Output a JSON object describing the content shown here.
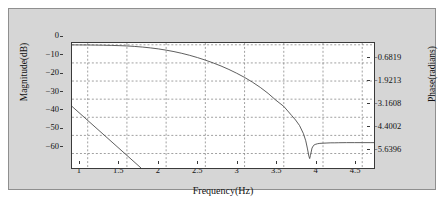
{
  "chart_data": {
    "type": "line",
    "title": "",
    "xlabel": "Frequency(Hz)",
    "ylabel": "Magnitude(dB)",
    "y2label": "Phase(radians)",
    "xlim": [
      0.8,
      4.65
    ],
    "ylim": [
      -68,
      1
    ],
    "y2lim": [
      -6.2661,
      0.5574
    ],
    "grid": true,
    "legend": null,
    "xticks": [
      "1",
      "1.5",
      "2",
      "2.5",
      "3",
      "3.5",
      "4",
      "4.5"
    ],
    "xtick_values": [
      1,
      1.5,
      2,
      2.5,
      3,
      3.5,
      4,
      4.5
    ],
    "yticks": [
      "0",
      "−10",
      "−20",
      "−30",
      "−40",
      "−50",
      "−60"
    ],
    "ytick_values": [
      0,
      -10,
      -20,
      -30,
      -40,
      -50,
      -60
    ],
    "y2ticks": [
      "−0.6819",
      "−1.9213",
      "−3.1608",
      "−4.4002",
      "−5.6396"
    ],
    "y2tick_values": [
      -0.6819,
      -1.9213,
      -3.1608,
      -4.4002,
      -5.6396
    ],
    "series": [
      {
        "name": "Magnitude",
        "axis": "left",
        "units": "dB",
        "color": "#4a4a4a",
        "x": [
          0.8,
          0.9,
          1.0,
          1.1,
          1.2,
          1.3,
          1.4,
          1.5,
          1.6,
          1.7,
          1.8,
          1.9,
          2.0,
          2.1,
          2.2,
          2.3,
          2.4,
          2.5,
          2.6,
          2.7,
          2.8,
          2.9,
          3.0,
          3.1,
          3.2,
          3.3,
          3.4,
          3.5,
          3.6,
          3.65,
          3.7,
          3.75,
          3.78,
          3.8,
          3.82,
          3.83,
          3.84,
          3.86,
          3.88,
          3.9,
          3.93,
          3.96,
          4.0,
          4.05,
          4.1,
          4.15,
          4.2,
          4.3,
          4.4,
          4.5,
          4.6,
          4.65
        ],
        "y": [
          -0.05,
          -0.07,
          -0.1,
          -0.15,
          -0.22,
          -0.32,
          -0.45,
          -0.62,
          -0.9,
          -1.25,
          -1.7,
          -2.25,
          -2.95,
          -3.75,
          -4.7,
          -5.8,
          -7.05,
          -8.45,
          -10.0,
          -11.7,
          -13.6,
          -15.7,
          -18.0,
          -20.6,
          -23.5,
          -26.8,
          -30.6,
          -34.0,
          -39.0,
          -41.5,
          -44.5,
          -49.0,
          -53.0,
          -57.0,
          -61.5,
          -62.8,
          -61.0,
          -57.0,
          -55.5,
          -55.0,
          -54.6,
          -54.4,
          -54.3,
          -54.2,
          -54.1,
          -54.1,
          -54.05,
          -54.0,
          -54.0,
          -54.0,
          -54.0,
          -54.0
        ]
      },
      {
        "name": "Phase",
        "axis": "right",
        "units": "radians",
        "color": "#4a4a4a",
        "x": [
          0.8,
          1.68
        ],
        "y_db": [
          -34.0,
          -68.0
        ],
        "y_radians": [
          -3.38,
          -6.27
        ]
      }
    ],
    "annotations": [
      {
        "text": "notch",
        "x": 3.83,
        "y": -62.8
      }
    ]
  },
  "axes": {
    "left_title": "Magnitude(dB)",
    "right_title": "Phase(radians)",
    "bottom_title": "Frequency(Hz)"
  },
  "colors": {
    "panel_background": "#d6d6d6",
    "plot_background": "#ffffff",
    "axis_line": "#3a3a3a",
    "grid_line": "#777777",
    "curve": "#4a4a4a",
    "text": "#111111"
  }
}
